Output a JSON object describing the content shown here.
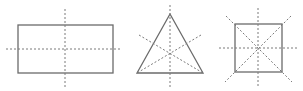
{
  "diagram": {
    "colors": {
      "background": "#ffffff",
      "outline": "#6b6b6b",
      "symmetry_line": "#7a7a7a"
    },
    "figures": [
      {
        "name": "rectangle",
        "symmetry_lines": 2,
        "outline": {
          "x": 18,
          "y": 25,
          "width": 95,
          "height": 48
        },
        "axes": [
          {
            "x1": 65,
            "y1": 9,
            "x2": 65,
            "y2": 89
          },
          {
            "x1": 6,
            "y1": 49,
            "x2": 122,
            "y2": 49
          }
        ]
      },
      {
        "name": "equilateral-triangle",
        "symmetry_lines": 3,
        "outline": {
          "points": "170,14 137,73 203,73"
        },
        "axes": [
          {
            "x1": 170,
            "y1": 5,
            "x2": 170,
            "y2": 87
          },
          {
            "x1": 139,
            "y1": 35,
            "x2": 203,
            "y2": 73
          },
          {
            "x1": 201,
            "y1": 35,
            "x2": 137,
            "y2": 73
          }
        ]
      },
      {
        "name": "square",
        "symmetry_lines": 4,
        "outline": {
          "x": 235,
          "y": 24,
          "width": 47,
          "height": 48
        },
        "axes": [
          {
            "x1": 258,
            "y1": 8,
            "x2": 258,
            "y2": 88
          },
          {
            "x1": 219,
            "y1": 48,
            "x2": 297,
            "y2": 48
          },
          {
            "x1": 226,
            "y1": 16,
            "x2": 292,
            "y2": 82
          },
          {
            "x1": 291,
            "y1": 16,
            "x2": 225,
            "y2": 82
          }
        ]
      }
    ]
  }
}
